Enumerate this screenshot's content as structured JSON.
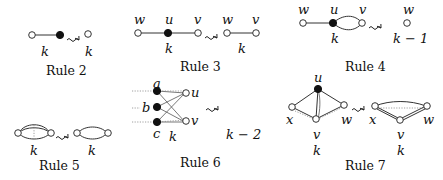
{
  "rules": [
    {
      "id": "rule2",
      "title": "Rule 2",
      "left_labels": [
        "k"
      ],
      "right_labels": [
        "k"
      ]
    },
    {
      "id": "rule3",
      "title": "Rule 3",
      "left_labels": [
        "w",
        "u",
        "v",
        "k"
      ],
      "right_labels": [
        "w",
        "v",
        "k"
      ]
    },
    {
      "id": "rule4",
      "title": "Rule 4",
      "left_labels": [
        "w",
        "u",
        "v",
        "k"
      ],
      "right_labels": [
        "w",
        "k − 1"
      ]
    },
    {
      "id": "rule5",
      "title": "Rule 5",
      "left_labels": [
        "k"
      ],
      "right_labels": [
        "k"
      ]
    },
    {
      "id": "rule6",
      "title": "Rule 6",
      "left_labels": [
        "a",
        "b",
        "c",
        "u",
        "v",
        "k"
      ],
      "right_labels": [
        "k − 2"
      ]
    },
    {
      "id": "rule7",
      "title": "Rule 7",
      "left_labels": [
        "u",
        "x",
        "v",
        "w",
        "k"
      ],
      "right_labels": [
        "x",
        "v",
        "w",
        "k"
      ]
    }
  ],
  "arrow_symbol": "⇝"
}
